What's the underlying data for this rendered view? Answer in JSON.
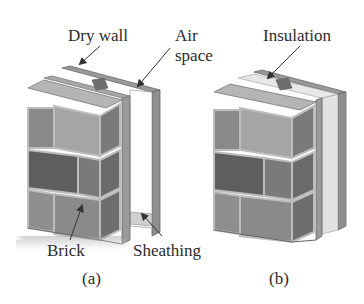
{
  "figure": {
    "panels": [
      {
        "id": "a",
        "caption": "(a)",
        "labels": {
          "drywall": "Dry wall",
          "air_space_line1": "Air",
          "air_space_line2": "space",
          "brick": "Brick",
          "sheathing": "Sheathing"
        }
      },
      {
        "id": "b",
        "caption": "(b)",
        "labels": {
          "insulation": "Insulation"
        }
      }
    ],
    "colors": {
      "brick_light": "#9a9a9a",
      "brick_mid": "#7d7d7d",
      "brick_dark": "#5e5e5e",
      "mortar": "#b8b8b8",
      "panel": "#8a8a8a",
      "air": "#ffffff",
      "insulation": "#e4e4e4",
      "arrow": "#333333"
    }
  }
}
